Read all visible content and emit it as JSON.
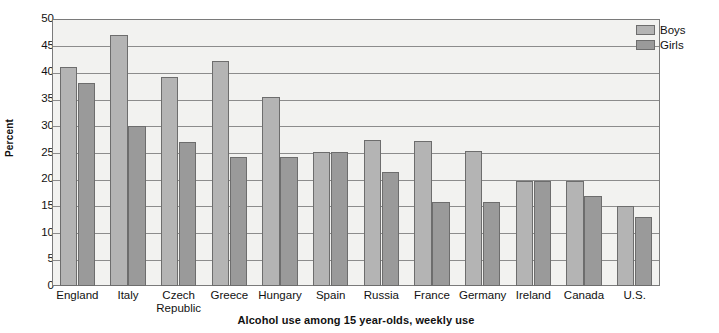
{
  "chart_data": {
    "type": "bar",
    "title": "",
    "caption": "Alcohol use among 15 year-olds, weekly use",
    "xlabel": "",
    "ylabel": "Percent",
    "ylim": [
      0,
      50
    ],
    "ytick_step": 5,
    "yticks": [
      "50",
      "45",
      "40",
      "35",
      "30",
      "25",
      "20",
      "15",
      "10",
      "5",
      "0"
    ],
    "grid": true,
    "legend_position": "top-right",
    "categories": [
      "England",
      "Italy",
      "Czech Republic",
      "Greece",
      "Hungary",
      "Spain",
      "Russia",
      "France",
      "Germany",
      "Ireland",
      "Canada",
      "U.S."
    ],
    "category_lines": [
      [
        "England"
      ],
      [
        "Italy"
      ],
      [
        "Czech",
        "Republic"
      ],
      [
        "Greece"
      ],
      [
        "Hungary"
      ],
      [
        "Spain"
      ],
      [
        "Russia"
      ],
      [
        "France"
      ],
      [
        "Germany"
      ],
      [
        "Ireland"
      ],
      [
        "Canada"
      ],
      [
        "U.S."
      ]
    ],
    "series": [
      {
        "name": "Boys",
        "color": "#b4b4b4",
        "values": [
          41.0,
          47.1,
          39.2,
          42.2,
          35.4,
          25.1,
          27.3,
          27.2,
          25.3,
          19.6,
          19.7,
          15.0
        ]
      },
      {
        "name": "Girls",
        "color": "#9a9a9a",
        "values": [
          38.1,
          29.9,
          27.0,
          24.1,
          24.1,
          25.1,
          21.3,
          15.8,
          15.8,
          19.6,
          16.9,
          13.0
        ]
      }
    ]
  },
  "legend": {
    "items": [
      {
        "label": "Boys",
        "color": "#b4b4b4"
      },
      {
        "label": "Girls",
        "color": "#9a9a9a"
      }
    ]
  }
}
